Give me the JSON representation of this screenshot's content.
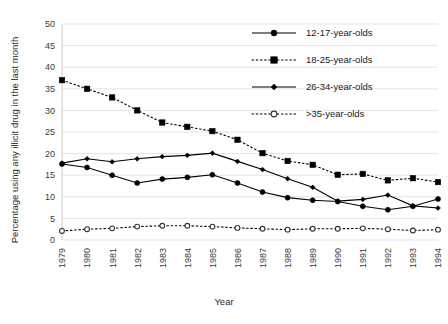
{
  "chart_data": {
    "type": "line",
    "title": "",
    "xlabel": "Year",
    "ylabel": "Percentage using any illicit drug in the last month",
    "x": [
      1979,
      1980,
      1981,
      1982,
      1983,
      1984,
      1985,
      1986,
      1987,
      1988,
      1989,
      1990,
      1991,
      1992,
      1993,
      1994
    ],
    "categories": [
      "1979",
      "1980",
      "1981",
      "1982",
      "1983",
      "1984",
      "1985",
      "1986",
      "1987",
      "1988",
      "1989",
      "1990",
      "1991",
      "1992",
      "1993",
      "1994"
    ],
    "ylim": [
      0,
      50
    ],
    "yticks": [
      0,
      5,
      10,
      15,
      20,
      25,
      30,
      35,
      40,
      45,
      50
    ],
    "ytick_labels": [
      "0",
      "5",
      "10",
      "15",
      "20",
      "25",
      "30",
      "35",
      "40",
      "45",
      "50"
    ],
    "grid": true,
    "legend_position": "top-right",
    "series": [
      {
        "name": "12-17-year-olds",
        "marker": "filled-circle",
        "linestyle": "solid",
        "color": "#000000",
        "values": [
          17.6,
          16.8,
          15.0,
          13.2,
          14.1,
          14.5,
          15.1,
          13.2,
          11.1,
          9.8,
          9.2,
          8.9,
          7.8,
          7.0,
          7.8,
          9.5
        ]
      },
      {
        "name": "18-25-year-olds",
        "marker": "filled-square",
        "linestyle": "dotted",
        "color": "#000000",
        "values": [
          37.0,
          35.0,
          33.0,
          30.0,
          27.2,
          26.2,
          25.2,
          23.2,
          20.1,
          18.3,
          17.4,
          15.1,
          15.3,
          13.8,
          14.3,
          13.4
        ]
      },
      {
        "name": "26-34-year-olds",
        "marker": "filled-diamond",
        "linestyle": "solid",
        "color": "#000000",
        "values": [
          17.8,
          18.8,
          18.1,
          18.8,
          19.3,
          19.6,
          20.1,
          18.2,
          16.3,
          14.2,
          12.2,
          9.0,
          9.4,
          10.4,
          7.9,
          7.4
        ]
      },
      {
        "name": ">35-year-olds",
        "marker": "open-circle",
        "linestyle": "dotted",
        "color": "#333333",
        "values": [
          2.1,
          2.5,
          2.7,
          3.1,
          3.3,
          3.3,
          3.1,
          2.8,
          2.6,
          2.4,
          2.6,
          2.6,
          2.7,
          2.5,
          2.2,
          2.4
        ]
      }
    ]
  },
  "legend": {
    "items": [
      {
        "label": "12-17-year-olds"
      },
      {
        "label": "18-25-year-olds"
      },
      {
        "label": "26-34-year-olds"
      },
      {
        "label": ">35-year-olds"
      }
    ]
  },
  "axes": {
    "x_title": "Year",
    "y_title": "Percentage using any illicit drug in the last month"
  }
}
